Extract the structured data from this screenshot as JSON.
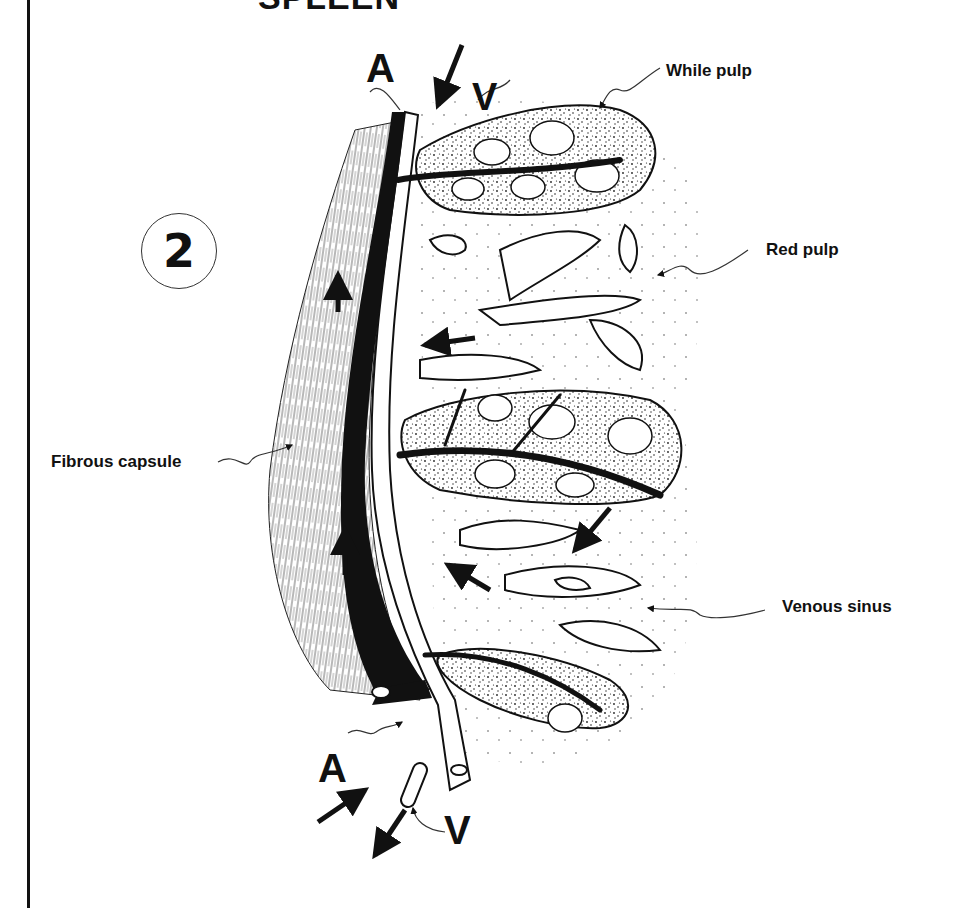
{
  "title": "SPLEEN",
  "figure_number": "2",
  "labels": {
    "artery_top": "A",
    "vein_top": "V",
    "artery_bottom": "A",
    "vein_bottom": "V",
    "white_pulp": "While pulp",
    "red_pulp": "Red pulp",
    "fibrous_capsule": "Fibrous capsule",
    "venous_sinus": "Venous sinus"
  },
  "colors": {
    "ink": "#111111",
    "paper": "#ffffff",
    "stipple": "#444444"
  }
}
